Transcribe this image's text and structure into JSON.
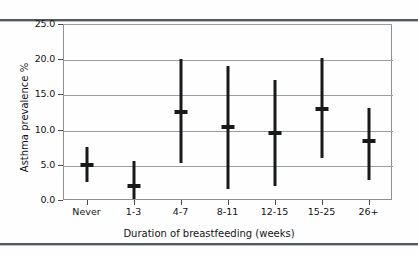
{
  "figure": {
    "y_axis_title": "Asthma prevalence %",
    "x_axis_title": "Duration of breastfeeding (weeks)"
  },
  "chart_data": {
    "type": "scatter",
    "subtype": "error-bar-plot",
    "title": "",
    "xlabel": "Duration of breastfeeding (weeks)",
    "ylabel": "Asthma prevalence %",
    "categories": [
      "Never",
      "1-3",
      "4-7",
      "8-11",
      "12-15",
      "15-25",
      "26+"
    ],
    "values": [
      5.0,
      2.0,
      12.5,
      10.3,
      9.5,
      12.9,
      8.4
    ],
    "error_low": [
      2.6,
      0.1,
      5.3,
      1.5,
      2.0,
      5.9,
      2.9
    ],
    "error_high": [
      7.5,
      5.5,
      20.0,
      19.0,
      17.0,
      20.2,
      13.1
    ],
    "series": [
      {
        "name": "Asthma prevalence %",
        "points": [
          {
            "category": "Never",
            "mean": 5.0,
            "lower": 2.6,
            "upper": 7.5
          },
          {
            "category": "1-3",
            "mean": 2.0,
            "lower": 0.1,
            "upper": 5.5
          },
          {
            "category": "4-7",
            "mean": 12.5,
            "lower": 5.3,
            "upper": 20.0
          },
          {
            "category": "8-11",
            "mean": 10.3,
            "lower": 1.5,
            "upper": 19.0
          },
          {
            "category": "12-15",
            "mean": 9.5,
            "lower": 2.0,
            "upper": 17.0
          },
          {
            "category": "15-25",
            "mean": 12.9,
            "lower": 5.9,
            "upper": 20.2
          },
          {
            "category": "26+",
            "mean": 8.4,
            "lower": 2.9,
            "upper": 13.1
          }
        ]
      }
    ],
    "ylim": [
      0.0,
      25.0
    ],
    "yticks": [
      0.0,
      5.0,
      10.0,
      15.0,
      20.0,
      25.0
    ],
    "ytick_labels": [
      "0.0",
      "5.0",
      "10.0",
      "15.0",
      "20.0",
      "25.0"
    ],
    "grid": "horizontal",
    "legend": "none",
    "marker_color": "#17191b",
    "grid_color": "#9a9ea1"
  }
}
